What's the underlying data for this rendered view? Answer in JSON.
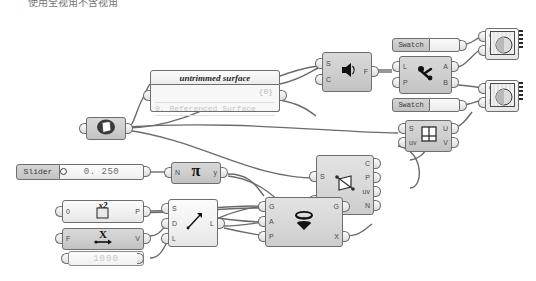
{
  "canvas": {
    "app": "Grasshopper Canvas",
    "top_note": "使用全视角不含视角",
    "background_color": "#ffffff",
    "wire_color": "#6b6b6b"
  },
  "panel": {
    "title": "untrimmed surface",
    "count": "{0}",
    "row": "0. Referenced Surface"
  },
  "slider": {
    "tag": "Slider",
    "value": "0. 250"
  },
  "number": {
    "value": "1000"
  },
  "swatches": [
    {
      "tag": "Swatch",
      "name": "swatch-top"
    },
    {
      "tag": "Swatch",
      "name": "swatch-bottom"
    }
  ],
  "nodes": [
    {
      "name": "surface-param",
      "icon": "surface-icon",
      "inputs": [
        ""
      ],
      "outputs": [
        ""
      ]
    },
    {
      "name": "surface-frame",
      "icon": "speaker-icon",
      "inputs": [
        "S",
        "C"
      ],
      "outputs": [
        "F"
      ]
    },
    {
      "name": "dispatch",
      "icon": "dispatch-icon",
      "inputs": [
        "L",
        "P"
      ],
      "outputs": [
        "A",
        "B"
      ]
    },
    {
      "name": "preview-top",
      "icon": "sphere-preview-icon",
      "inputs": [
        "G",
        "S"
      ],
      "outputs": []
    },
    {
      "name": "preview-bottom",
      "icon": "sphere-preview-icon",
      "inputs": [
        "G",
        "S"
      ],
      "outputs": []
    },
    {
      "name": "evaluate-surface",
      "icon": "uv-grid-icon",
      "inputs": [
        "S",
        "uv"
      ],
      "outputs": [
        "U",
        "V"
      ]
    },
    {
      "name": "surface-line-intersection",
      "icon": "intersect-icon",
      "inputs": [
        "S",
        "L"
      ],
      "outputs": [
        "C",
        "P",
        "uv",
        "N"
      ]
    },
    {
      "name": "pi",
      "icon": "pi-icon",
      "inputs": [
        "N"
      ],
      "outputs": [
        "y"
      ]
    },
    {
      "name": "square-root",
      "icon": "x2-icon",
      "inputs": [
        "0"
      ],
      "outputs": [
        "P"
      ]
    },
    {
      "name": "expression",
      "icon": "x-arrow-icon",
      "inputs": [
        "F"
      ],
      "outputs": [
        "V"
      ]
    },
    {
      "name": "line-sdl",
      "icon": "arrow-line-icon",
      "inputs": [
        "S",
        "D",
        "L"
      ],
      "outputs": [
        "L"
      ]
    },
    {
      "name": "rotate",
      "icon": "rotate-icon",
      "inputs": [
        "G",
        "A",
        "P"
      ],
      "outputs": [
        "G",
        "X"
      ]
    }
  ]
}
